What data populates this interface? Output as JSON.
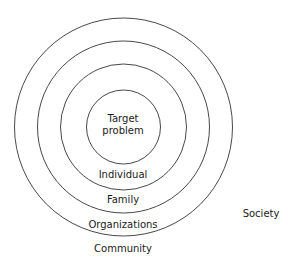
{
  "diagram": {
    "type": "concentric-circles",
    "stroke_color": "#333333",
    "layers": [
      {
        "label_line1": "Target",
        "label_line2": "problem",
        "radius": 37
      },
      {
        "label": "Individual",
        "radius": 60
      },
      {
        "label": "Family",
        "radius": 86
      },
      {
        "label": "Organizations",
        "radius": 109
      },
      {
        "label": "Community"
      },
      {
        "label": "Society"
      }
    ]
  }
}
